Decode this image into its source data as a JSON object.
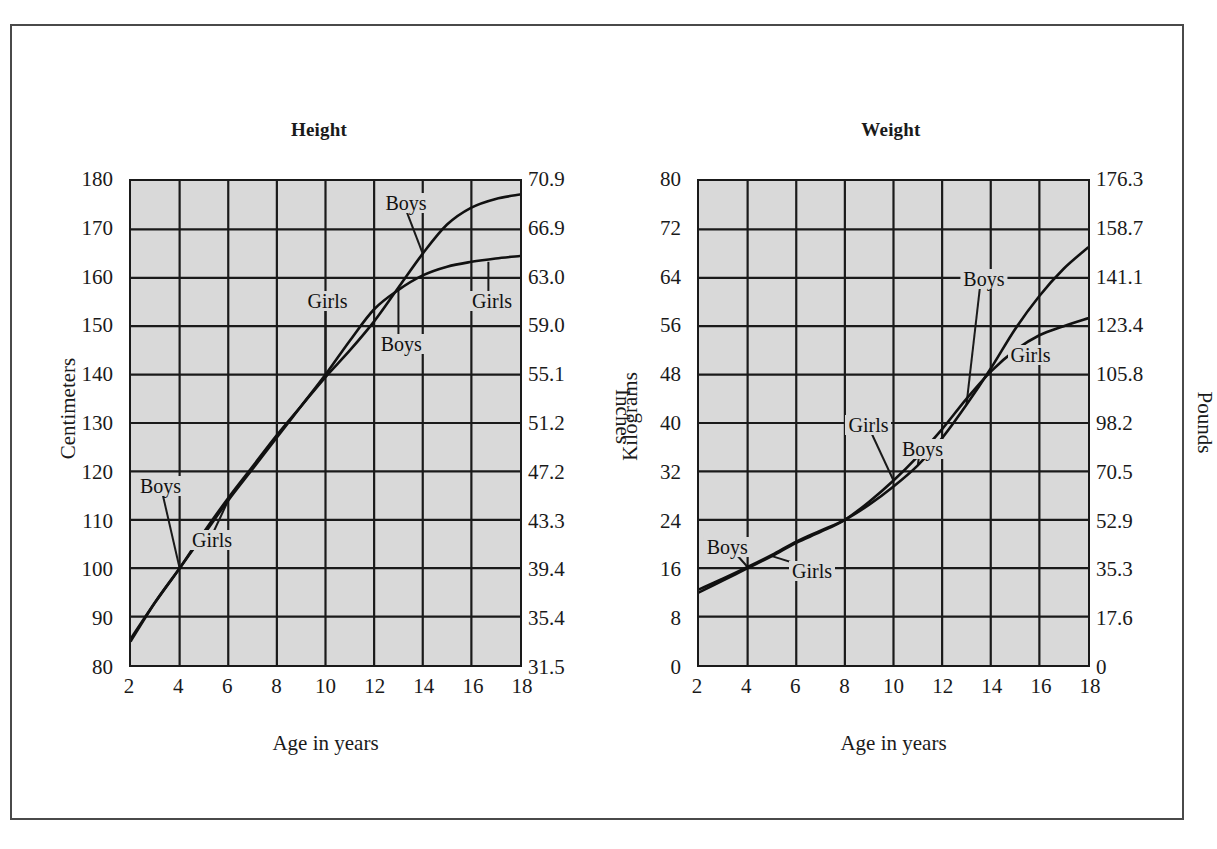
{
  "page": {
    "background": "#ffffff",
    "frame_color": "#4a4a4a"
  },
  "figures": [
    {
      "id": "height",
      "title": "Height",
      "ylabel": "Centimeters",
      "y2label": "Inches",
      "xlabel": "Age in years"
    },
    {
      "id": "weight",
      "title": "Weight",
      "ylabel": "Kilograms",
      "y2label": "Pounds",
      "xlabel": "Age in years"
    }
  ],
  "chart_data": [
    {
      "type": "line",
      "title": "Height",
      "xlabel": "Age in years",
      "ylabel": "Centimeters",
      "y2label": "Inches",
      "grid": true,
      "legend_position": "inline-annotations",
      "xlim": [
        2,
        18
      ],
      "ylim": [
        80,
        180
      ],
      "xticks": [
        2,
        4,
        6,
        8,
        10,
        12,
        14,
        16,
        18
      ],
      "xticklabels": [
        "2",
        "4",
        "6",
        "8",
        "10",
        "12",
        "14",
        "16",
        "18"
      ],
      "yticks": [
        80,
        90,
        100,
        110,
        120,
        130,
        140,
        150,
        160,
        170,
        180
      ],
      "yticklabels": [
        "80",
        "90",
        "100",
        "110",
        "120",
        "130",
        "140",
        "150",
        "160",
        "170",
        "180"
      ],
      "y2ticks": [
        80,
        90,
        100,
        110,
        120,
        130,
        140,
        150,
        160,
        170,
        180
      ],
      "y2ticklabels": [
        "31.5",
        "35.4",
        "39.4",
        "43.3",
        "47.2",
        "51.2",
        "55.1",
        "59.0",
        "63.0",
        "66.9",
        "70.9"
      ],
      "x": [
        2,
        3,
        4,
        5,
        6,
        7,
        8,
        9,
        10,
        11,
        12,
        13,
        14,
        15,
        16,
        17,
        18
      ],
      "series": [
        {
          "name": "Boys",
          "values": [
            85.5,
            93.0,
            100.0,
            107.5,
            114.5,
            121.0,
            127.5,
            133.5,
            139.5,
            145.0,
            151.0,
            158.0,
            165.0,
            171.0,
            174.5,
            176.3,
            177.2
          ]
        },
        {
          "name": "Girls",
          "values": [
            85.0,
            93.0,
            100.0,
            107.0,
            114.0,
            120.5,
            127.0,
            133.5,
            140.0,
            147.0,
            153.5,
            157.5,
            160.5,
            162.3,
            163.3,
            164.0,
            164.5
          ]
        }
      ],
      "annotations": [
        {
          "text": "Boys",
          "series": "Boys",
          "x": 3.2,
          "y": 117.5,
          "leader_to_x": 4,
          "leader_to_y": 100
        },
        {
          "text": "Girls",
          "series": "Girls",
          "x": 5.3,
          "y": 106.5,
          "leader_to_x": 6,
          "leader_to_y": 114
        },
        {
          "text": "Girls",
          "series": "Girls",
          "x": 10.0,
          "y": 155.5,
          "leader_to_x": 10,
          "leader_to_y": 140
        },
        {
          "text": "Boys",
          "series": "Boys",
          "x": 13.0,
          "y": 146.5,
          "leader_to_x": 13,
          "leader_to_y": 158
        },
        {
          "text": "Boys",
          "series": "Boys",
          "x": 13.2,
          "y": 175.5,
          "leader_to_x": 14,
          "leader_to_y": 165
        },
        {
          "text": "Girls",
          "series": "Girls",
          "x": 16.7,
          "y": 155.5,
          "leader_to_x": 16.7,
          "leader_to_y": 163.3
        }
      ]
    },
    {
      "type": "line",
      "title": "Weight",
      "xlabel": "Age in years",
      "ylabel": "Kilograms",
      "y2label": "Pounds",
      "grid": true,
      "legend_position": "inline-annotations",
      "xlim": [
        2,
        18
      ],
      "ylim": [
        0,
        80
      ],
      "xticks": [
        2,
        4,
        6,
        8,
        10,
        12,
        14,
        16,
        18
      ],
      "xticklabels": [
        "2",
        "4",
        "6",
        "8",
        "10",
        "12",
        "14",
        "16",
        "18"
      ],
      "yticks": [
        0,
        8,
        16,
        24,
        32,
        40,
        48,
        56,
        64,
        72,
        80
      ],
      "yticklabels": [
        "0",
        "8",
        "16",
        "24",
        "32",
        "40",
        "48",
        "56",
        "64",
        "72",
        "80"
      ],
      "y2ticks": [
        0,
        8,
        16,
        24,
        32,
        40,
        48,
        56,
        64,
        72,
        80
      ],
      "y2ticklabels": [
        "0",
        "17.6",
        "35.3",
        "52.9",
        "70.5",
        "98.2",
        "105.8",
        "123.4",
        "141.1",
        "158.7",
        "176.3"
      ],
      "x": [
        2,
        3,
        4,
        5,
        6,
        7,
        8,
        9,
        10,
        11,
        12,
        13,
        14,
        15,
        16,
        17,
        18
      ],
      "series": [
        {
          "name": "Boys",
          "values": [
            12.5,
            14.3,
            16.2,
            18.2,
            20.4,
            22.2,
            24.0,
            26.5,
            29.5,
            33.0,
            37.5,
            43.0,
            49.0,
            55.5,
            61.0,
            65.5,
            69.0
          ]
        },
        {
          "name": "Girls",
          "values": [
            12.0,
            14.0,
            16.0,
            18.0,
            20.2,
            22.0,
            24.0,
            27.0,
            30.5,
            34.5,
            39.0,
            44.0,
            48.5,
            52.0,
            54.5,
            56.0,
            57.3
          ]
        }
      ],
      "annotations": [
        {
          "text": "Boys",
          "series": "Boys",
          "x": 3.15,
          "y": 20.0,
          "leader_to_x": 4,
          "leader_to_y": 16.2
        },
        {
          "text": "Girls",
          "series": "Girls",
          "x": 6.6,
          "y": 16.0,
          "leader_to_x": 5,
          "leader_to_y": 18.0
        },
        {
          "text": "Girls",
          "series": "Girls",
          "x": 8.9,
          "y": 40.0,
          "leader_to_x": 10,
          "leader_to_y": 30.5
        },
        {
          "text": "Boys",
          "series": "Boys",
          "x": 11.1,
          "y": 36.0,
          "leader_to_x": 11,
          "leader_to_y": 33.0
        },
        {
          "text": "Boys",
          "series": "Boys",
          "x": 13.6,
          "y": 64.0,
          "leader_to_x": 13,
          "leader_to_y": 43.0
        },
        {
          "text": "Girls",
          "series": "Girls",
          "x": 15.5,
          "y": 51.5,
          "leader_to_x": 15,
          "leader_to_y": 52.0
        }
      ]
    }
  ]
}
